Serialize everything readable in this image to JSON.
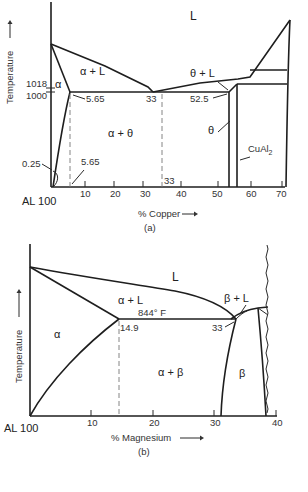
{
  "diagram_a": {
    "caption": "(a)",
    "y_axis_label": "Temperature",
    "x_axis_label": "% Copper",
    "origin_label": "AL 100",
    "x_ticks": [
      "10",
      "20",
      "30",
      "40",
      "50",
      "60",
      "70"
    ],
    "temp_labels": [
      "1018",
      "1000"
    ],
    "regions": {
      "liquid": "L",
      "alpha": "α",
      "alpha_liquid": "α + L",
      "alpha_theta": "α + θ",
      "theta_liquid": "θ + L",
      "theta": "θ",
      "cual2": "CuAl",
      "cual2_sub": "2"
    },
    "annotations": {
      "solvus_max": "5.65",
      "eutectic": "33",
      "theta_left": "52.5",
      "low_solubility": "0.25",
      "base_565": "5.65",
      "base_33": "33"
    }
  },
  "diagram_b": {
    "caption": "(b)",
    "y_axis_label": "Temperature",
    "x_axis_label": "% Magnesium",
    "origin_label": "AL 100",
    "x_ticks": [
      "10",
      "20",
      "30",
      "40"
    ],
    "regions": {
      "liquid": "L",
      "alpha": "α",
      "alpha_liquid": "α + L",
      "alpha_beta": "α + β",
      "beta_liquid": "β + L",
      "beta": "β"
    },
    "annotations": {
      "eutectic_temp": "844° F",
      "solvus_max": "14.9",
      "eutectic": "33"
    }
  }
}
